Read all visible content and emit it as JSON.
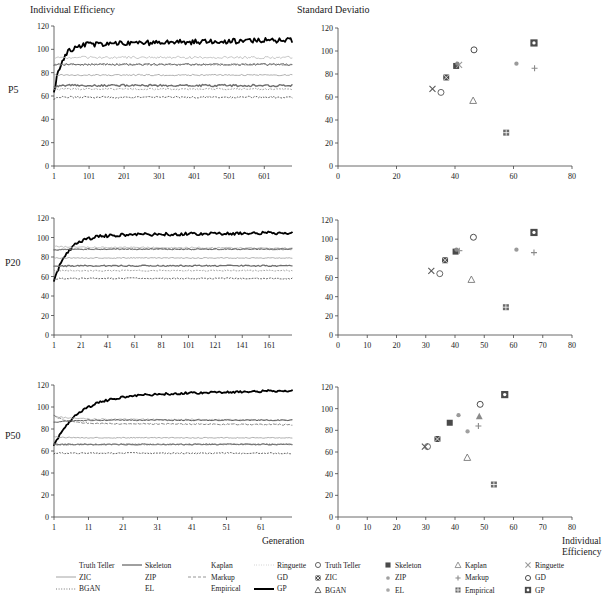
{
  "figure": {
    "left_column_title": "Individual Efficiency",
    "right_column_title": "Standard Deviatio",
    "row_labels": [
      "P5",
      "P20",
      "P50"
    ],
    "x_axis_label_left": "Generation",
    "x_axis_label_right_line1": "Individual",
    "x_axis_label_right_line2": "Efficiency"
  },
  "chart_data": [
    {
      "id": "p5-lines",
      "type": "line",
      "title": "Individual Efficiency",
      "row": "P5",
      "xlabel": "Generation",
      "ylabel": "",
      "xlim": [
        1,
        680
      ],
      "ylim": [
        0,
        120
      ],
      "yticks": [
        0,
        20,
        40,
        60,
        80,
        100,
        120
      ],
      "xticks": [
        1,
        101,
        201,
        301,
        401,
        501,
        601
      ],
      "grid": false,
      "series": [
        {
          "name": "GP",
          "color": "#000000",
          "width": 1.8,
          "dash": "none",
          "start": 63,
          "plateau": 104,
          "rise": 22,
          "noise": 2.2,
          "drift": 4
        },
        {
          "name": "Ringuette",
          "color": "#b8b8b8",
          "width": 0.8,
          "dash": "none",
          "start": 92,
          "plateau": 93,
          "rise": 6,
          "noise": 1.0,
          "drift": 0
        },
        {
          "name": "Skeleton",
          "color": "#545454",
          "width": 0.9,
          "dash": "none",
          "start": 86,
          "plateau": 87,
          "rise": 6,
          "noise": 0.8,
          "drift": 0
        },
        {
          "name": "Kaplan",
          "color": "#7a7a7a",
          "width": 0.8,
          "dash": "2 2",
          "start": 86,
          "plateau": 87,
          "rise": 6,
          "noise": 0.7,
          "drift": 0
        },
        {
          "name": "Markup",
          "color": "#9a9a9a",
          "width": 0.8,
          "dash": "none",
          "start": 78,
          "plateau": 78,
          "rise": 4,
          "noise": 0.6,
          "drift": 0
        },
        {
          "name": "ZIC",
          "color": "#6e6e6e",
          "width": 1.4,
          "dash": "none",
          "start": 67,
          "plateau": 69,
          "rise": 8,
          "noise": 0.9,
          "drift": 0
        },
        {
          "name": "EL",
          "color": "#8c8c8c",
          "width": 0.8,
          "dash": "1 2",
          "start": 65,
          "plateau": 66,
          "rise": 5,
          "noise": 0.7,
          "drift": 0
        },
        {
          "name": "BGAN",
          "color": "#3a3a3a",
          "width": 0.8,
          "dash": "1 2",
          "start": 58,
          "plateau": 59,
          "rise": 5,
          "noise": 0.8,
          "drift": 0
        }
      ]
    },
    {
      "id": "p5-scatter",
      "type": "scatter",
      "title": "Standard Deviatio",
      "row": "P5",
      "xlabel": "Individual Efficiency",
      "ylabel": "",
      "xlim": [
        0,
        80
      ],
      "ylim": [
        0,
        120
      ],
      "xticks": [
        0,
        20,
        40,
        60,
        80
      ],
      "yticks": [
        0,
        20,
        40,
        60,
        80,
        100,
        120
      ],
      "grid": false,
      "points": [
        {
          "name": "Truth Teller",
          "x": 35.2,
          "y": 64,
          "marker": "circle-open",
          "color": "#555555"
        },
        {
          "name": "Skeleton",
          "x": 40.4,
          "y": 87,
          "marker": "square-fill",
          "color": "#4a4a4a"
        },
        {
          "name": "Kaplan",
          "x": 46.2,
          "y": 57,
          "marker": "tri-open",
          "color": "#777777"
        },
        {
          "name": "Ringuette",
          "x": 41.4,
          "y": 88,
          "marker": "x-mark",
          "color": "#9a9a9a"
        },
        {
          "name": "ZIC",
          "x": 37.0,
          "y": 77,
          "marker": "square-x",
          "color": "#4a4a4a"
        },
        {
          "name": "ZIP",
          "x": 61.0,
          "y": 89,
          "marker": "dot-small",
          "color": "#9a9a9a"
        },
        {
          "name": "Markup",
          "x": 67.2,
          "y": 85,
          "marker": "plus-small",
          "color": "#8a8a8a"
        },
        {
          "name": "GD",
          "x": 46.5,
          "y": 101,
          "marker": "circle-open",
          "color": "#3a3a3a"
        },
        {
          "name": "BGAN",
          "x": 32.3,
          "y": 67,
          "marker": "x-mark",
          "color": "#5a5a5a"
        },
        {
          "name": "EL",
          "x": 40.8,
          "y": 89,
          "marker": "dot-small",
          "color": "#8a8a8a"
        },
        {
          "name": "Empirical",
          "x": 57.5,
          "y": 29,
          "marker": "square-grid",
          "color": "#6a6a6a"
        },
        {
          "name": "GP",
          "x": 67.0,
          "y": 107,
          "marker": "square-target",
          "color": "#4a4a4a"
        }
      ]
    },
    {
      "id": "p20-lines",
      "type": "line",
      "title": "Individual Efficiency",
      "row": "P20",
      "xlabel": "Generation",
      "ylabel": "",
      "xlim": [
        1,
        178
      ],
      "ylim": [
        0,
        120
      ],
      "yticks": [
        0,
        20,
        40,
        60,
        80,
        100,
        120
      ],
      "xticks": [
        1,
        21,
        41,
        61,
        81,
        101,
        121,
        141,
        161
      ],
      "grid": false,
      "series": [
        {
          "name": "GP",
          "color": "#000000",
          "width": 1.8,
          "dash": "none",
          "start": 55,
          "plateau": 102,
          "rise": 10,
          "noise": 1.6,
          "drift": 3
        },
        {
          "name": "Ringuette",
          "color": "#b0b0b0",
          "width": 0.8,
          "dash": "none",
          "start": 92,
          "plateau": 90,
          "rise": 5,
          "noise": 0.7,
          "drift": -1
        },
        {
          "name": "Skeleton",
          "color": "#4a4a4a",
          "width": 0.9,
          "dash": "none",
          "start": 87,
          "plateau": 88,
          "rise": 5,
          "noise": 0.6,
          "drift": 0
        },
        {
          "name": "Kaplan",
          "color": "#7a7a7a",
          "width": 0.8,
          "dash": "2 2",
          "start": 87,
          "plateau": 88,
          "rise": 5,
          "noise": 0.6,
          "drift": 0
        },
        {
          "name": "Markup",
          "color": "#9a9a9a",
          "width": 0.8,
          "dash": "none",
          "start": 79,
          "plateau": 79,
          "rise": 4,
          "noise": 0.5,
          "drift": 0
        },
        {
          "name": "ZIC",
          "color": "#6e6e6e",
          "width": 1.3,
          "dash": "none",
          "start": 70,
          "plateau": 71,
          "rise": 5,
          "noise": 0.7,
          "drift": 0
        },
        {
          "name": "EL",
          "color": "#8c8c8c",
          "width": 0.8,
          "dash": "1 2",
          "start": 66,
          "plateau": 66,
          "rise": 4,
          "noise": 0.6,
          "drift": 0
        },
        {
          "name": "BGAN",
          "color": "#3a3a3a",
          "width": 0.8,
          "dash": "1 2",
          "start": 57,
          "plateau": 58,
          "rise": 4,
          "noise": 0.7,
          "drift": 0
        }
      ]
    },
    {
      "id": "p20-scatter",
      "type": "scatter",
      "title": "Standard Deviatio",
      "row": "P20",
      "xlabel": "Individual Efficiency",
      "ylabel": "",
      "xlim": [
        0,
        80
      ],
      "ylim": [
        0,
        120
      ],
      "xticks": [
        0,
        10,
        20,
        30,
        40,
        50,
        60,
        70,
        80
      ],
      "yticks": [
        0,
        20,
        40,
        60,
        80,
        100,
        120
      ],
      "grid": false,
      "points": [
        {
          "name": "Truth Teller",
          "x": 34.8,
          "y": 64,
          "marker": "circle-open",
          "color": "#555555"
        },
        {
          "name": "Skeleton",
          "x": 40.2,
          "y": 87,
          "marker": "square-fill",
          "color": "#4a4a4a"
        },
        {
          "name": "Kaplan",
          "x": 45.6,
          "y": 58,
          "marker": "tri-open",
          "color": "#777777"
        },
        {
          "name": "Ringuette",
          "x": 41.5,
          "y": 88,
          "marker": "plus-small",
          "color": "#9a9a9a"
        },
        {
          "name": "ZIC",
          "x": 36.6,
          "y": 78,
          "marker": "square-x",
          "color": "#4a4a4a"
        },
        {
          "name": "ZIP",
          "x": 61.0,
          "y": 89,
          "marker": "dot-small",
          "color": "#9a9a9a"
        },
        {
          "name": "Markup",
          "x": 67.0,
          "y": 86,
          "marker": "plus-small",
          "color": "#8a8a8a"
        },
        {
          "name": "GD",
          "x": 46.3,
          "y": 102,
          "marker": "circle-open",
          "color": "#3a3a3a"
        },
        {
          "name": "BGAN",
          "x": 31.9,
          "y": 67,
          "marker": "x-mark",
          "color": "#5a5a5a"
        },
        {
          "name": "EL",
          "x": 40.5,
          "y": 89,
          "marker": "dot-small",
          "color": "#8a8a8a"
        },
        {
          "name": "Empirical",
          "x": 57.4,
          "y": 29,
          "marker": "square-grid",
          "color": "#6a6a6a"
        },
        {
          "name": "GP",
          "x": 67.0,
          "y": 107,
          "marker": "square-target",
          "color": "#4a4a4a"
        }
      ]
    },
    {
      "id": "p50-lines",
      "type": "line",
      "title": "Individual Efficiency",
      "row": "P50",
      "xlabel": "Generation",
      "ylabel": "",
      "xlim": [
        1,
        70
      ],
      "ylim": [
        0,
        120
      ],
      "yticks": [
        0,
        20,
        40,
        60,
        80,
        100,
        120
      ],
      "xticks": [
        1,
        11,
        21,
        31,
        41,
        51,
        61
      ],
      "grid": false,
      "series": [
        {
          "name": "GP",
          "color": "#000000",
          "width": 1.8,
          "dash": "none",
          "start": 65,
          "plateau": 110,
          "rise": 7,
          "noise": 1.0,
          "drift": 5
        },
        {
          "name": "Ringuette",
          "color": "#a8a8a8",
          "width": 0.8,
          "dash": "none",
          "start": 92,
          "plateau": 89,
          "rise": 4,
          "noise": 0.6,
          "drift": -1
        },
        {
          "name": "Skeleton",
          "color": "#4a4a4a",
          "width": 0.9,
          "dash": "none",
          "start": 86,
          "plateau": 88,
          "rise": 4,
          "noise": 0.5,
          "drift": 0
        },
        {
          "name": "Kaplan",
          "color": "#6a6a6a",
          "width": 0.8,
          "dash": "3 2",
          "start": 92,
          "plateau": 85,
          "rise": 4,
          "noise": 0.6,
          "drift": -1
        },
        {
          "name": "Markup",
          "color": "#9a9a9a",
          "width": 0.8,
          "dash": "none",
          "start": 73,
          "plateau": 72,
          "rise": 3,
          "noise": 0.4,
          "drift": 0
        },
        {
          "name": "ZIC",
          "color": "#707070",
          "width": 1.2,
          "dash": "none",
          "start": 66,
          "plateau": 66,
          "rise": 3,
          "noise": 0.5,
          "drift": 0
        },
        {
          "name": "EL",
          "color": "#8c8c8c",
          "width": 0.8,
          "dash": "1 2",
          "start": 65,
          "plateau": 66,
          "rise": 3,
          "noise": 0.6,
          "drift": 0
        },
        {
          "name": "BGAN",
          "color": "#3a3a3a",
          "width": 0.8,
          "dash": "1 2",
          "start": 58,
          "plateau": 58,
          "rise": 3,
          "noise": 0.6,
          "drift": 0
        }
      ]
    },
    {
      "id": "p50-scatter",
      "type": "scatter",
      "title": "Standard Deviatio",
      "row": "P50",
      "xlabel": "Individual Efficiency",
      "ylabel": "",
      "xlim": [
        0,
        80
      ],
      "ylim": [
        0,
        120
      ],
      "xticks": [
        0,
        10,
        20,
        30,
        40,
        50,
        60,
        70,
        80
      ],
      "yticks": [
        0,
        20,
        40,
        60,
        80,
        100,
        120
      ],
      "grid": false,
      "points": [
        {
          "name": "Truth Teller",
          "x": 30.6,
          "y": 65,
          "marker": "circle-open",
          "color": "#555555"
        },
        {
          "name": "Skeleton",
          "x": 38.2,
          "y": 87,
          "marker": "square-fill",
          "color": "#4a4a4a"
        },
        {
          "name": "Kaplan",
          "x": 44.2,
          "y": 55,
          "marker": "tri-open",
          "color": "#777777"
        },
        {
          "name": "Ringuette",
          "x": 48.3,
          "y": 93,
          "marker": "tri-fill",
          "color": "#8a8a8a"
        },
        {
          "name": "ZIC",
          "x": 34.0,
          "y": 72,
          "marker": "square-x",
          "color": "#4a4a4a"
        },
        {
          "name": "ZIP",
          "x": 41.2,
          "y": 94,
          "marker": "dot-small",
          "color": "#9a9a9a"
        },
        {
          "name": "Markup",
          "x": 48.0,
          "y": 84,
          "marker": "plus-small",
          "color": "#8a8a8a"
        },
        {
          "name": "GD",
          "x": 48.6,
          "y": 104,
          "marker": "circle-open",
          "color": "#3a3a3a"
        },
        {
          "name": "BGAN",
          "x": 29.7,
          "y": 65,
          "marker": "x-mark",
          "color": "#5a5a5a"
        },
        {
          "name": "EL",
          "x": 44.3,
          "y": 79,
          "marker": "dot-small",
          "color": "#a0a0a0"
        },
        {
          "name": "Empirical",
          "x": 53.3,
          "y": 30,
          "marker": "square-grid",
          "color": "#6a6a6a"
        },
        {
          "name": "GP",
          "x": 57.0,
          "y": 113,
          "marker": "square-target",
          "color": "#4a4a4a"
        }
      ]
    }
  ],
  "legend_left": {
    "rows": [
      [
        {
          "label": "Truth Teller",
          "style": "none",
          "color": "#ffffff"
        },
        {
          "label": "Skeleton",
          "style": "solid",
          "color": "#2b2b2b"
        },
        {
          "label": "Kaplan",
          "style": "none",
          "color": "#ffffff"
        },
        {
          "label": "Ringuette",
          "style": "dotted-fine",
          "color": "#b0b0b0"
        }
      ],
      [
        {
          "label": "ZIC",
          "style": "solid",
          "color": "#9a9a9a"
        },
        {
          "label": "ZIP",
          "style": "none",
          "color": "#ffffff"
        },
        {
          "label": "Markup",
          "style": "dash-short",
          "color": "#8a8a8a"
        },
        {
          "label": "GD",
          "style": "none",
          "color": "#ffffff"
        }
      ],
      [
        {
          "label": "BGAN",
          "style": "dotted",
          "color": "#6a6a6a"
        },
        {
          "label": "EL",
          "style": "none",
          "color": "#ffffff"
        },
        {
          "label": "Empirical",
          "style": "none",
          "color": "#ffffff"
        },
        {
          "label": "GP",
          "style": "thick",
          "color": "#000000"
        }
      ]
    ]
  },
  "legend_right": {
    "rows": [
      [
        {
          "label": "Truth Teller",
          "marker": "circle-open",
          "color": "#555555"
        },
        {
          "label": "Skeleton",
          "marker": "square-fill",
          "color": "#4a4a4a"
        },
        {
          "label": "Kaplan",
          "marker": "tri-open",
          "color": "#8a8a8a"
        },
        {
          "label": "Ringuette",
          "marker": "x-mark",
          "color": "#9a9a9a"
        }
      ],
      [
        {
          "label": "ZIC",
          "marker": "square-x",
          "color": "#4a4a4a"
        },
        {
          "label": "ZIP",
          "marker": "dot-small",
          "color": "#a0a0a0"
        },
        {
          "label": "Markup",
          "marker": "plus-small",
          "color": "#8a8a8a"
        },
        {
          "label": "GD",
          "marker": "circle-open",
          "color": "#3a3a3a"
        }
      ],
      [
        {
          "label": "BGAN",
          "marker": "tri-open",
          "color": "#5a5a5a"
        },
        {
          "label": "EL",
          "marker": "dot-small",
          "color": "#a8a8a8"
        },
        {
          "label": "Empirical",
          "marker": "square-grid",
          "color": "#6a6a6a"
        },
        {
          "label": "GP",
          "marker": "square-target",
          "color": "#4a4a4a"
        }
      ]
    ]
  }
}
